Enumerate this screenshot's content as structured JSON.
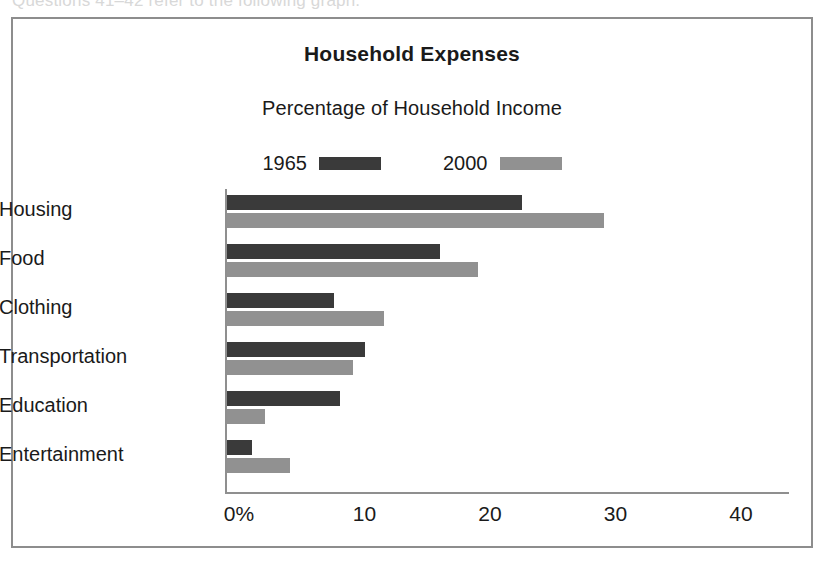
{
  "page": {
    "cropped_text_above": "Questions 41–42 refer to the following graph."
  },
  "figure": {
    "title": "Household Expenses",
    "subtitle": "Percentage of Household Income"
  },
  "legend": {
    "position": "top-center",
    "entries": [
      {
        "label": "1965",
        "color": "#3a3a3a"
      },
      {
        "label": "2000",
        "color": "#919191"
      }
    ]
  },
  "axis": {
    "x_ticks": [
      "0%",
      "10",
      "20",
      "30",
      "40"
    ],
    "x_tick_values": [
      0,
      10,
      20,
      30,
      40
    ]
  },
  "chart_data": {
    "type": "bar",
    "orientation": "horizontal",
    "title": "Household Expenses",
    "subtitle": "Percentage of Household Income",
    "xlabel": "",
    "ylabel": "",
    "xlim": [
      0,
      45
    ],
    "grid": false,
    "legend_position": "top-center",
    "categories": [
      "Housing",
      "Food",
      "Clothing",
      "Transportation",
      "Education",
      "Entertainment"
    ],
    "series": [
      {
        "name": "1965",
        "color": "#3a3a3a",
        "values": [
          23.5,
          17,
          8.5,
          11,
          9,
          2
        ]
      },
      {
        "name": "2000",
        "color": "#919191",
        "values": [
          30,
          20,
          12.5,
          10,
          3,
          5
        ]
      }
    ]
  }
}
